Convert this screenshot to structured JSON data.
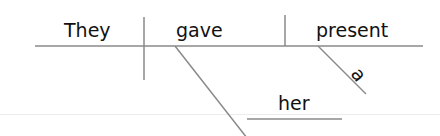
{
  "diagram": {
    "type": "Reed-Kellogg sentence diagram",
    "sentence": "They gave her a present",
    "words": {
      "subject": "They",
      "verb": "gave",
      "direct_object": "present",
      "article": "a",
      "indirect_object": "her"
    },
    "colors": {
      "text": "#111111",
      "lines": "#8a8a8a",
      "background": "#ffffff",
      "faint_rule": "#ececec"
    }
  }
}
